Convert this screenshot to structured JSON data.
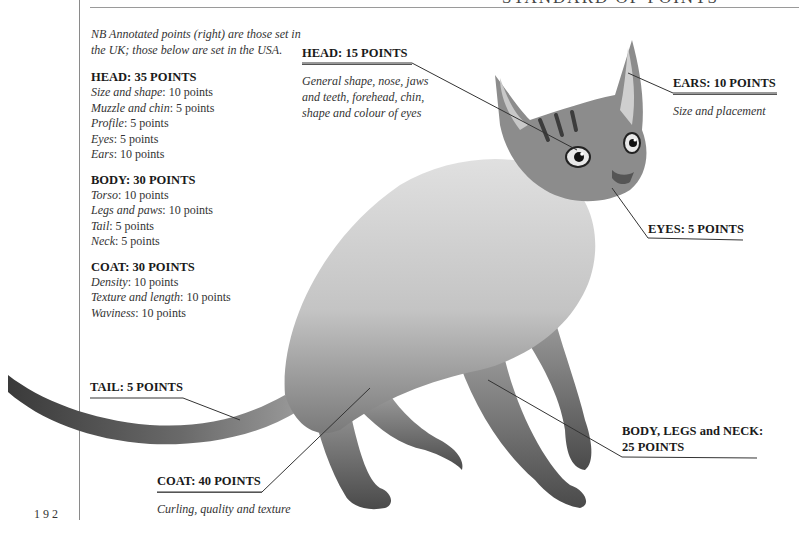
{
  "page": {
    "top_heading": "STANDARD OF POINTS",
    "page_number": "192"
  },
  "left_column": {
    "intro": "NB Annotated points (right) are those set in the UK; those below are set in the USA.",
    "sections": [
      {
        "title": "HEAD: 35 POINTS",
        "items": [
          {
            "label": "Size and shape",
            "value": "10 points"
          },
          {
            "label": "Muzzle and chin",
            "value": "5 points"
          },
          {
            "label": "Profile",
            "value": "5 points"
          },
          {
            "label": "Eyes",
            "value": "5 points"
          },
          {
            "label": "Ears",
            "value": "10 points"
          }
        ]
      },
      {
        "title": "BODY: 30 POINTS",
        "items": [
          {
            "label": "Torso",
            "value": "10 points"
          },
          {
            "label": "Legs and paws",
            "value": "10 points"
          },
          {
            "label": "Tail",
            "value": "5 points"
          },
          {
            "label": "Neck",
            "value": "5 points"
          }
        ]
      },
      {
        "title": "COAT: 30 POINTS",
        "items": [
          {
            "label": "Density",
            "value": "10 points"
          },
          {
            "label": "Texture and length",
            "value": "10 points"
          },
          {
            "label": "Waviness",
            "value": "10 points"
          }
        ]
      }
    ]
  },
  "callouts": {
    "head": {
      "title": "HEAD: 15 POINTS",
      "desc": "General shape, nose, jaws and teeth, forehead, chin, shape and colour of eyes"
    },
    "ears": {
      "title": "EARS: 10 POINTS",
      "desc": "Size and placement"
    },
    "eyes": {
      "title": "EYES: 5 POINTS"
    },
    "tail": {
      "title": "TAIL: 5 POINTS"
    },
    "coat": {
      "title": "COAT: 40 POINTS",
      "desc": "Curling, quality and texture"
    },
    "body": {
      "title_line1": "BODY, LEGS and NECK:",
      "title_line2": "25 POINTS"
    }
  },
  "illustration": {
    "subject": "cat-illustration",
    "colors": {
      "fur_light": "#d9d9d9",
      "fur_mid": "#a8a8a8",
      "fur_dark": "#5a5a5a",
      "leader_line": "#333333"
    }
  }
}
